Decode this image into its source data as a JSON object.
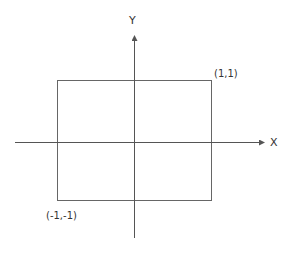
{
  "diagram": {
    "axes": {
      "x_label": "X",
      "y_label": "Y"
    },
    "rectangle": {
      "top_right_label": "(1,1)",
      "bottom_left_label": "(-1,-1)"
    },
    "colors": {
      "line": "#555555",
      "text": "#333333",
      "background": "#ffffff"
    }
  }
}
